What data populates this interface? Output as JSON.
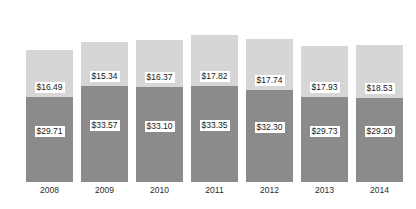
{
  "chart_data": {
    "type": "bar",
    "subtype": "stacked-bar",
    "title": "",
    "xlabel": "",
    "ylabel": "",
    "grid": false,
    "legend": "none",
    "categories": [
      "2008",
      "2009",
      "2010",
      "2011",
      "2012",
      "2013",
      "2014"
    ],
    "series": [
      {
        "name": "bottom-segment",
        "color": "#8b8b8b",
        "values": [
          29.71,
          33.57,
          33.1,
          33.35,
          32.3,
          29.73,
          29.2
        ],
        "labels": [
          "$29.71",
          "$33.57",
          "$33.10",
          "$33.35",
          "$32.30",
          "$29.73",
          "$29.20"
        ]
      },
      {
        "name": "top-segment",
        "color": "#d6d6d6",
        "values": [
          16.49,
          15.34,
          16.37,
          17.82,
          17.74,
          17.93,
          18.53
        ],
        "labels": [
          "$16.49",
          "$15.34",
          "$16.37",
          "$17.82",
          "$17.74",
          "$17.93",
          "$18.53"
        ]
      }
    ],
    "totals": [
      46.2,
      48.91,
      49.47,
      51.17,
      50.04,
      47.66,
      47.73
    ],
    "ylim": [
      0,
      55
    ]
  },
  "bars": [
    {
      "year": "2008",
      "left": 26,
      "bottom_label": "$29.71",
      "top_label": "$16.49",
      "bottom_px": 85,
      "top_px": 47
    },
    {
      "year": "2009",
      "left": 81,
      "bottom_label": "$33.57",
      "top_label": "$15.34",
      "bottom_px": 96,
      "top_px": 44
    },
    {
      "year": "2010",
      "left": 136,
      "bottom_label": "$33.10",
      "top_label": "$16.37",
      "bottom_px": 95,
      "top_px": 47
    },
    {
      "year": "2011",
      "left": 191,
      "bottom_label": "$33.35",
      "top_label": "$17.82",
      "bottom_px": 96,
      "top_px": 51
    },
    {
      "year": "2012",
      "left": 246,
      "bottom_label": "$32.30",
      "top_label": "$17.74",
      "bottom_px": 92,
      "top_px": 51
    },
    {
      "year": "2013",
      "left": 301,
      "bottom_label": "$29.73",
      "top_label": "$17.93",
      "bottom_px": 85,
      "top_px": 51
    },
    {
      "year": "2014",
      "left": 356,
      "bottom_label": "$29.20",
      "top_label": "$18.53",
      "bottom_px": 84,
      "top_px": 53
    }
  ],
  "colors": {
    "segment_top": "#d6d6d6",
    "segment_bottom": "#8b8b8b",
    "label_background": "#ffffff",
    "label_text": "#1a1a1a",
    "axis_text": "#2b2b2b",
    "background": "#ffffff"
  }
}
